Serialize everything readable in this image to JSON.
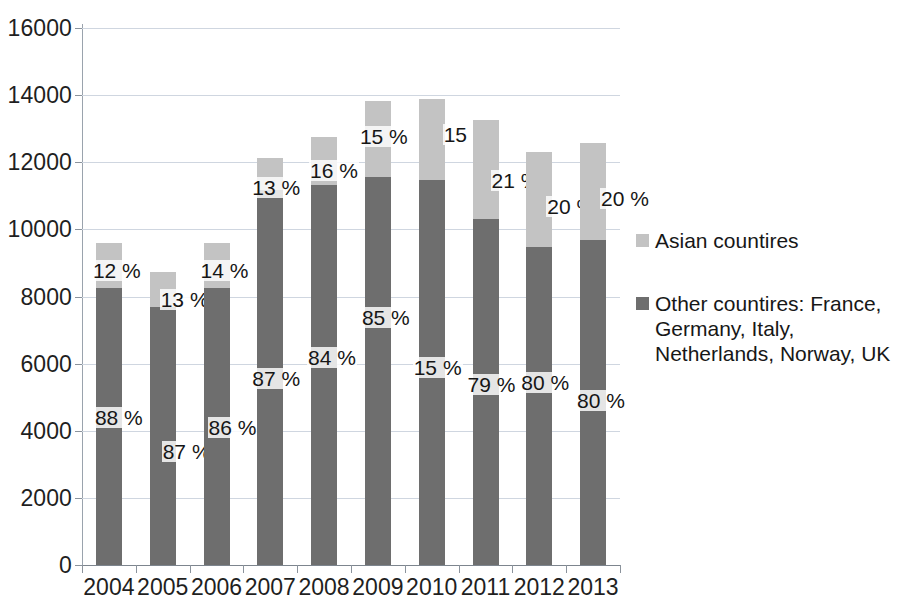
{
  "chart_data": {
    "type": "bar",
    "subtype": "stacked-bar",
    "title": "",
    "subtitle": "",
    "xlabel": "",
    "ylabel": "",
    "ylim": [
      0,
      16000
    ],
    "ytick_step": 2000,
    "ytick_labels": [
      "16000",
      "14000",
      "12000",
      "10000",
      "8000",
      "6000",
      "4000",
      "2000",
      "0"
    ],
    "ytick_values": [
      16000,
      14000,
      12000,
      10000,
      8000,
      6000,
      4000,
      2000,
      0
    ],
    "grid": true,
    "grid_axis": "y",
    "legend_position": "right",
    "categories": [
      "2004",
      "2005",
      "2006",
      "2007",
      "2008",
      "2009",
      "2010",
      "2011",
      "2012",
      "2013"
    ],
    "series": [
      {
        "name": "Other countires:  France, Germany,  Italy, Netherlands, Norway, UK",
        "color": "#6e6e6e",
        "stack_order": 0,
        "values": [
          8250,
          7690,
          8250,
          11170,
          11330,
          11560,
          11470,
          10310,
          9480,
          9690
        ],
        "data_labels": [
          "88 %",
          "87 %",
          "86 %",
          "87 %",
          "84 %",
          "85 %",
          "15 %",
          "79 %",
          "80 %",
          "80 %"
        ]
      },
      {
        "name": "Asian countires",
        "color": "#c3c3c3",
        "stack_order": 1,
        "values": [
          1350,
          1040,
          1350,
          960,
          1420,
          2270,
          2420,
          2950,
          2830,
          2890
        ],
        "data_labels": [
          "12 %",
          "13 %",
          "14 %",
          "13 %",
          "16 %",
          "15 %",
          "15 %",
          "21 %",
          "20 %",
          "20 %"
        ]
      }
    ],
    "totals": [
      9600,
      8730,
      9600,
      12130,
      12750,
      13830,
      13890,
      13260,
      12310,
      12580
    ]
  },
  "legend": {
    "entries": [
      {
        "label": "Asian countires",
        "color": "#c3c3c3"
      },
      {
        "label": "Other countires:  France, Germany,  Italy, Netherlands, Norway, UK",
        "color": "#6e6e6e"
      }
    ]
  },
  "colors": {
    "series_light": "#c3c3c3",
    "series_dark": "#6e6e6e",
    "gridline": "#cfd6e0",
    "axis": "#8b939c",
    "background": "#ffffff",
    "text": "#1a1a1a"
  }
}
